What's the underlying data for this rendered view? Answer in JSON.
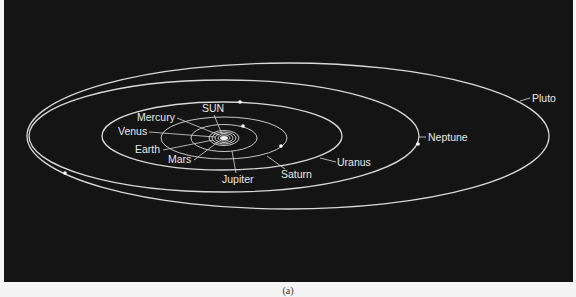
{
  "figure": {
    "caption": "(a)",
    "background_color": "#141414",
    "line_color": "#d8d8d8"
  },
  "sun": {
    "label": "SUN",
    "cx": 224,
    "cy": 138
  },
  "orbits": [
    {
      "name": "Mercury",
      "cx": 224,
      "cy": 138,
      "rx": 6,
      "ry": 3
    },
    {
      "name": "Venus",
      "cx": 224,
      "cy": 138,
      "rx": 9,
      "ry": 4.5
    },
    {
      "name": "Earth",
      "cx": 224,
      "cy": 138,
      "rx": 12,
      "ry": 6
    },
    {
      "name": "Mars",
      "cx": 224,
      "cy": 138,
      "rx": 15,
      "ry": 7.5
    },
    {
      "name": "Jupiter",
      "cx": 224,
      "cy": 138,
      "rx": 33,
      "ry": 13.5
    },
    {
      "name": "Saturn",
      "cx": 224,
      "cy": 138,
      "rx": 63,
      "ry": 21
    },
    {
      "name": "Uranus",
      "cx": 222,
      "cy": 136,
      "rx": 120,
      "ry": 34
    },
    {
      "name": "Neptune",
      "cx": 224,
      "cy": 136,
      "rx": 195,
      "ry": 56
    },
    {
      "name": "Pluto",
      "cx": 288,
      "cy": 136,
      "rx": 261,
      "ry": 73
    }
  ],
  "planet_dots": [
    {
      "orbit": "Jupiter",
      "x": 243,
      "y": 126
    },
    {
      "orbit": "Saturn",
      "x": 281,
      "y": 146
    },
    {
      "orbit": "Uranus",
      "x": 240,
      "y": 102
    },
    {
      "orbit": "Neptune",
      "x": 418,
      "y": 144
    },
    {
      "orbit": "Pluto",
      "x": 65,
      "y": 173
    }
  ],
  "labels": [
    {
      "text": "SUN",
      "x": 202,
      "y": 112,
      "line": [
        214,
        115,
        222,
        134
      ]
    },
    {
      "text": "Mercury",
      "x": 137,
      "y": 121,
      "line": [
        177,
        118,
        219,
        135
      ]
    },
    {
      "text": "Venus",
      "x": 118,
      "y": 135,
      "line": [
        149,
        132,
        215,
        137
      ]
    },
    {
      "text": "Earth",
      "x": 135,
      "y": 153,
      "line": [
        163,
        150,
        213,
        140
      ]
    },
    {
      "text": "Mars",
      "x": 168,
      "y": 163,
      "line": [
        194,
        160,
        218,
        142
      ]
    },
    {
      "text": "Jupiter",
      "x": 222,
      "y": 183,
      "line": [
        236,
        173,
        232,
        151
      ]
    },
    {
      "text": "Saturn",
      "x": 281,
      "y": 178,
      "line": [
        285,
        169,
        267,
        156
      ]
    },
    {
      "text": "Uranus",
      "x": 337,
      "y": 166,
      "line": [
        336,
        162,
        320,
        158
      ]
    },
    {
      "text": "Neptune",
      "x": 428,
      "y": 141,
      "line": [
        426,
        137,
        419,
        137
      ]
    },
    {
      "text": "Pluto",
      "x": 532,
      "y": 102,
      "line": [
        530,
        98,
        520,
        101
      ]
    }
  ]
}
